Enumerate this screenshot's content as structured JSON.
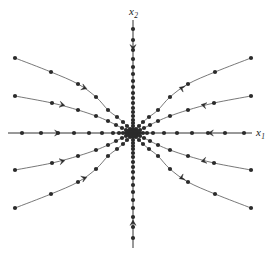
{
  "figure": {
    "type": "phase-portrait",
    "background_color": "#ffffff",
    "width": 272,
    "height": 254
  },
  "axes": {
    "horizontal": {
      "name": "x1",
      "label": "x",
      "label_sub": "1",
      "y_pixel": 133,
      "x_start": 8,
      "x_end": 252,
      "arrow_left_at": 58,
      "arrow_right_at": 210,
      "color": "#333333"
    },
    "vertical": {
      "name": "x2",
      "label": "x",
      "label_sub": "2",
      "x_pixel": 133,
      "y_start": 20,
      "y_end": 248,
      "arrow_up_at": 48,
      "arrow_down_at": 222,
      "color": "#333333"
    }
  },
  "marker": {
    "shape": "filled-circle",
    "radius": 2.1,
    "color": "#2b2b2b"
  },
  "curve": {
    "stroke_color": "#555555",
    "stroke_width": 0.8
  },
  "chart_data": {
    "type": "scatter",
    "title": "",
    "xlabel": "x₁",
    "ylabel": "x₂",
    "grid": false,
    "legend": "none",
    "origin": [
      133,
      133
    ],
    "xlim": [
      -125,
      119
    ],
    "ylim": [
      -115,
      113
    ],
    "flow_direction": "toward-origin",
    "trajectories": [
      {
        "name": "axis-positive-x1",
        "kind": "straight",
        "points_px": [
          [
            244,
            133
          ],
          [
            225,
            133
          ],
          [
            208,
            133
          ],
          [
            192,
            133
          ],
          [
            177,
            133
          ],
          [
            164,
            133
          ],
          [
            153,
            133
          ],
          [
            147,
            133
          ],
          [
            143,
            133
          ],
          [
            140,
            133
          ],
          [
            138,
            133
          ],
          [
            136,
            133
          ],
          [
            135,
            133
          ],
          [
            134,
            133
          ]
        ],
        "arrow_at_px": [
          210,
          133
        ],
        "arrow_angle": 180
      },
      {
        "name": "axis-negative-x1",
        "kind": "straight",
        "points_px": [
          [
            22,
            133
          ],
          [
            41,
            133
          ],
          [
            58,
            133
          ],
          [
            74,
            133
          ],
          [
            89,
            133
          ],
          [
            102,
            133
          ],
          [
            113,
            133
          ],
          [
            119,
            133
          ],
          [
            123,
            133
          ],
          [
            126,
            133
          ],
          [
            128,
            133
          ],
          [
            130,
            133
          ],
          [
            131,
            133
          ],
          [
            132,
            133
          ]
        ],
        "arrow_at_px": [
          58,
          133
        ],
        "arrow_angle": 0
      },
      {
        "name": "axis-positive-x2",
        "kind": "straight",
        "points_px": [
          [
            133,
            29
          ],
          [
            133,
            40
          ],
          [
            133,
            50
          ],
          [
            133,
            59
          ],
          [
            133,
            67
          ],
          [
            133,
            74
          ],
          [
            133,
            81
          ],
          [
            133,
            87
          ],
          [
            133,
            93
          ],
          [
            133,
            98
          ],
          [
            133,
            103
          ],
          [
            133,
            108
          ],
          [
            133,
            112
          ],
          [
            133,
            116
          ],
          [
            133,
            120
          ],
          [
            133,
            123
          ],
          [
            133,
            126
          ],
          [
            133,
            129
          ]
        ],
        "arrow_at_px": [
          133,
          48
        ],
        "arrow_angle": 90
      },
      {
        "name": "axis-negative-x2",
        "kind": "straight",
        "points_px": [
          [
            133,
            238
          ],
          [
            133,
            227
          ],
          [
            133,
            217
          ],
          [
            133,
            208
          ],
          [
            133,
            200
          ],
          [
            133,
            192
          ],
          [
            133,
            185
          ],
          [
            133,
            178
          ],
          [
            133,
            172
          ],
          [
            133,
            167
          ],
          [
            133,
            162
          ],
          [
            133,
            157
          ],
          [
            133,
            153
          ],
          [
            133,
            149
          ],
          [
            133,
            146
          ],
          [
            133,
            143
          ],
          [
            133,
            140
          ],
          [
            133,
            137
          ]
        ],
        "arrow_at_px": [
          133,
          222
        ],
        "arrow_angle": 270
      },
      {
        "name": "q2-outer",
        "kind": "curved",
        "points_px": [
          [
            15,
            58
          ],
          [
            51,
            72
          ],
          [
            78,
            84
          ],
          [
            96,
            97
          ],
          [
            108,
            110
          ],
          [
            117,
            117
          ],
          [
            123,
            122
          ],
          [
            127,
            126
          ],
          [
            130,
            129
          ],
          [
            131,
            131
          ]
        ],
        "arrow_at_px": [
          85,
          88
        ],
        "arrow_angle": 20
      },
      {
        "name": "q2-inner",
        "kind": "curved",
        "points_px": [
          [
            15,
            96
          ],
          [
            52,
            103
          ],
          [
            78,
            110
          ],
          [
            96,
            116
          ],
          [
            108,
            121
          ],
          [
            116,
            125
          ],
          [
            122,
            128
          ],
          [
            126,
            130
          ],
          [
            129,
            131
          ],
          [
            131,
            132
          ]
        ],
        "arrow_at_px": [
          63,
          105
        ],
        "arrow_angle": 12
      },
      {
        "name": "q1-outer",
        "kind": "curved",
        "points_px": [
          [
            251,
            58
          ],
          [
            215,
            72
          ],
          [
            188,
            84
          ],
          [
            170,
            97
          ],
          [
            158,
            110
          ],
          [
            149,
            117
          ],
          [
            143,
            122
          ],
          [
            139,
            126
          ],
          [
            136,
            129
          ],
          [
            135,
            131
          ]
        ],
        "arrow_at_px": [
          181,
          88
        ],
        "arrow_angle": 200
      },
      {
        "name": "q1-inner",
        "kind": "curved",
        "points_px": [
          [
            251,
            96
          ],
          [
            214,
            103
          ],
          [
            188,
            110
          ],
          [
            170,
            116
          ],
          [
            158,
            121
          ],
          [
            150,
            125
          ],
          [
            144,
            128
          ],
          [
            140,
            130
          ],
          [
            137,
            131
          ],
          [
            135,
            132
          ]
        ],
        "arrow_at_px": [
          203,
          105
        ],
        "arrow_angle": 192
      },
      {
        "name": "q3-inner",
        "kind": "curved",
        "points_px": [
          [
            15,
            170
          ],
          [
            52,
            163
          ],
          [
            78,
            156
          ],
          [
            96,
            150
          ],
          [
            108,
            145
          ],
          [
            116,
            141
          ],
          [
            122,
            138
          ],
          [
            126,
            136
          ],
          [
            129,
            135
          ],
          [
            131,
            134
          ]
        ],
        "arrow_at_px": [
          63,
          161
        ],
        "arrow_angle": -12
      },
      {
        "name": "q3-outer",
        "kind": "curved",
        "points_px": [
          [
            15,
            208
          ],
          [
            51,
            194
          ],
          [
            78,
            182
          ],
          [
            96,
            169
          ],
          [
            108,
            156
          ],
          [
            117,
            149
          ],
          [
            123,
            144
          ],
          [
            127,
            140
          ],
          [
            130,
            137
          ],
          [
            131,
            135
          ]
        ],
        "arrow_at_px": [
          85,
          178
        ],
        "arrow_angle": -20
      },
      {
        "name": "q4-inner",
        "kind": "curved",
        "points_px": [
          [
            251,
            170
          ],
          [
            214,
            163
          ],
          [
            188,
            156
          ],
          [
            170,
            150
          ],
          [
            158,
            145
          ],
          [
            150,
            141
          ],
          [
            144,
            138
          ],
          [
            140,
            136
          ],
          [
            137,
            135
          ],
          [
            135,
            134
          ]
        ],
        "arrow_at_px": [
          203,
          161
        ],
        "arrow_angle": 168
      },
      {
        "name": "q4-outer",
        "kind": "curved",
        "points_px": [
          [
            251,
            208
          ],
          [
            215,
            194
          ],
          [
            188,
            182
          ],
          [
            170,
            169
          ],
          [
            158,
            156
          ],
          [
            149,
            149
          ],
          [
            143,
            144
          ],
          [
            139,
            140
          ],
          [
            136,
            137
          ],
          [
            135,
            135
          ]
        ],
        "arrow_at_px": [
          181,
          178
        ],
        "arrow_angle": 160
      }
    ]
  }
}
